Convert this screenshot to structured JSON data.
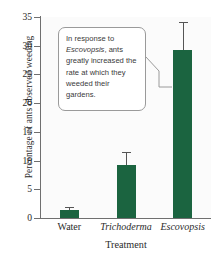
{
  "chart_data": {
    "type": "bar",
    "title": "",
    "xlabel": "Treatment",
    "ylabel": "Percentage of ants observed weeding",
    "categories": [
      "Water",
      "Trichoderma",
      "Escovopsis"
    ],
    "categories_italic": [
      false,
      true,
      true
    ],
    "values": [
      1.4,
      9.3,
      29.3
    ],
    "errors_upper": [
      0.5,
      2.2,
      4.8
    ],
    "ylim": [
      0,
      35
    ],
    "yticks": [
      0,
      5,
      10,
      15,
      20,
      25,
      30,
      35
    ],
    "ytick_labels": [
      "0",
      "5",
      "10",
      "15",
      "20",
      "25",
      "30",
      "35"
    ],
    "grid": false,
    "legend": "none",
    "series": [
      {
        "name": "Percentage of ants observed weeding",
        "values": [
          1.4,
          9.3,
          29.3
        ],
        "color": "#1b6440"
      }
    ],
    "annotations": [
      {
        "name": "escovopsis-callout",
        "text_before": "In response to ",
        "text_italic": "Escovopsis",
        "text_after": ", ants greatly increased the rate at which they weeded their gardens.",
        "points_to": "Escovopsis"
      }
    ]
  },
  "axes": {
    "y_title": "Percentage of ants observed weeding",
    "x_title": "Treatment"
  },
  "colors": {
    "bar": "#1b6440",
    "axis": "#6f6f6f",
    "error_bar": "#555555",
    "plot_background": "#fbfbfb",
    "callout_border": "#9a9a9a",
    "text": "#2b2b2b"
  }
}
